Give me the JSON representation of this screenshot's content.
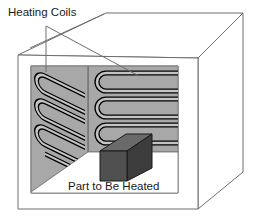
{
  "figure": {
    "type": "technical-illustration",
    "view": "3D perspective cutaway"
  },
  "labels": {
    "heating_coils": "Heating Coils",
    "part_to_be_heated": "Part to Be Heated"
  },
  "colors": {
    "outline": "#6e6e6e",
    "wall_fill": "#a8a8a8",
    "floor_fill": "#ffffff",
    "coil_stroke": "#000000",
    "coil_fill": "#c4c4c4",
    "part_front": "#505050",
    "part_top": "#6a6a6a",
    "part_side": "#3c3c3c",
    "text": "#1a1a1a",
    "background": "#ffffff"
  },
  "components": {
    "back_wall_coil": {
      "name": "back-wall-heating-coil",
      "pattern": "horizontal serpentine",
      "passes": 4,
      "u_turns": 3
    },
    "left_wall_coil": {
      "name": "left-wall-heating-coil",
      "pattern": "slanted serpentine",
      "passes": 4,
      "u_turns": 3
    },
    "part": {
      "name": "part-to-be-heated",
      "shape": "rectangular block"
    }
  }
}
